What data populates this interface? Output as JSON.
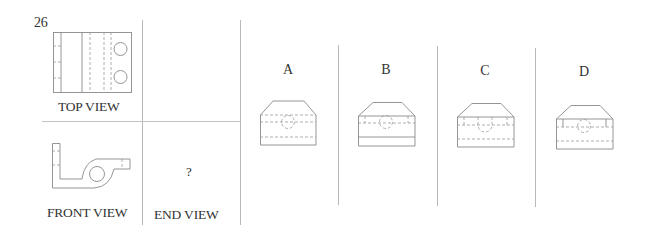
{
  "question": {
    "number": "26",
    "views": {
      "top_view_label": "TOP VIEW",
      "front_view_label": "FRONT VIEW",
      "end_view_label": "END VIEW",
      "end_view_placeholder": "?"
    },
    "options": [
      {
        "letter": "A"
      },
      {
        "letter": "B"
      },
      {
        "letter": "C"
      },
      {
        "letter": "D"
      }
    ]
  },
  "colors": {
    "line": "#8a8a8a",
    "divider": "#b8b8b8",
    "text": "#333333"
  }
}
